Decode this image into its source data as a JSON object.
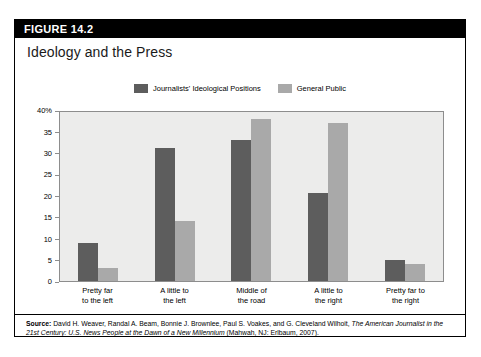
{
  "figure": {
    "number_label": "FIGURE 14.2",
    "title": "Ideology and the Press"
  },
  "legend": {
    "position": "top-center",
    "entries": [
      {
        "label": "Journalists' Ideological Positions",
        "color": "#5d5d5d"
      },
      {
        "label": "General Public",
        "color": "#a9a9a9"
      }
    ]
  },
  "source": {
    "prefix": "Source:",
    "text_1": " David H. Weaver, Randal A. Beam, Bonnie J. Brownlee, Paul S. Voakes, and G. Cleveland Wilhoit, ",
    "italic_1": "The American Journalist in the 21st Century: U.S. News People at the Dawn of a New Millennium",
    "text_2": " (Mahwah, NJ: Erlbaum, 2007)."
  },
  "chart_data": {
    "type": "bar",
    "title": "Ideology and the Press",
    "xlabel": "",
    "ylabel": "",
    "ylim": [
      0,
      40
    ],
    "yticks": [
      0,
      5,
      10,
      15,
      20,
      25,
      30,
      35,
      40
    ],
    "ytick_labels": [
      "0",
      "5",
      "10",
      "15",
      "20",
      "25",
      "30",
      "35",
      "40%"
    ],
    "grid": false,
    "categories": [
      "Pretty far to the left",
      "A little to the left",
      "Middle of the road",
      "A little to the right",
      "Pretty far to the right"
    ],
    "category_lines": [
      [
        "Pretty far",
        "to the left"
      ],
      [
        "A little to",
        "the left"
      ],
      [
        "Middle of",
        "the road"
      ],
      [
        "A little to",
        "the right"
      ],
      [
        "Pretty far to",
        "the right"
      ]
    ],
    "series": [
      {
        "name": "Journalists' Ideological Positions",
        "color": "#5d5d5d",
        "values": [
          9,
          31,
          33,
          20.5,
          5
        ]
      },
      {
        "name": "General Public",
        "color": "#a9a9a9",
        "values": [
          3,
          14,
          38,
          37,
          4
        ]
      }
    ]
  }
}
